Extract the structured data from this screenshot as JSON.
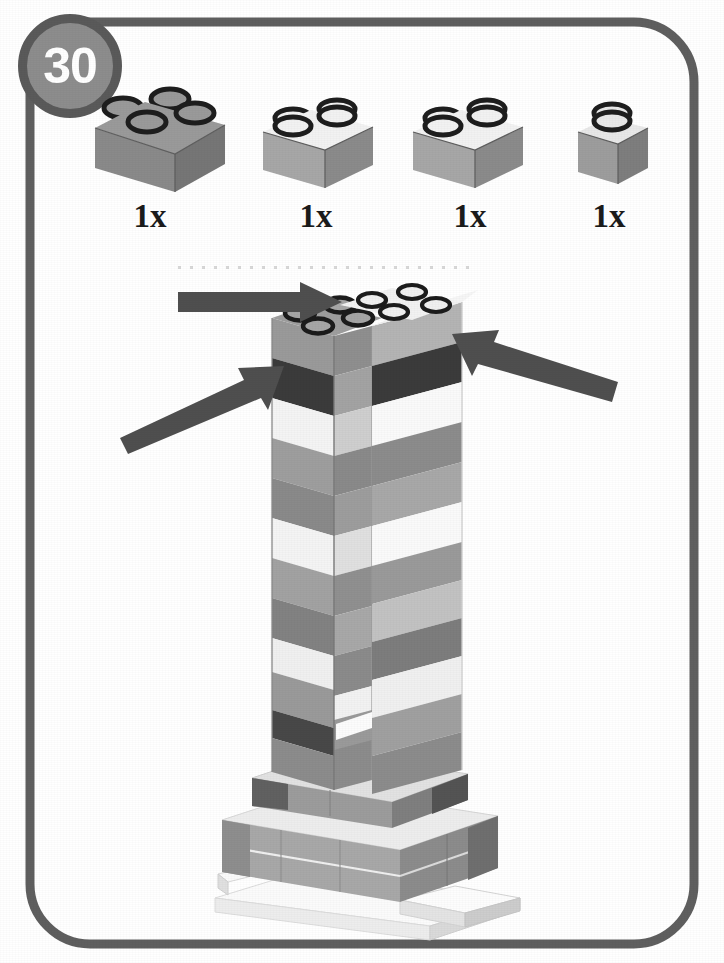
{
  "page": {
    "step_number": "30",
    "background_color": "#ffffff",
    "frame_color": "#5f5f5f",
    "badge_fill_color": "#8d8d8d",
    "badge_ring_color": "#5a5a5a",
    "badge_text_color": "#ffffff"
  },
  "parts_bin": {
    "items": [
      {
        "icon": "lego-brick-2x2-icon",
        "quantity_label": "1x",
        "brick_size": "2x2",
        "top_color": "#9a9a9a",
        "left_color": "#8a8a8a",
        "right_color": "#7a7a7a",
        "stud_color": "#1e1e1e"
      },
      {
        "icon": "lego-brick-2x1-icon",
        "quantity_label": "1x",
        "brick_size": "2x1",
        "top_color": "#f2f2f2",
        "left_color": "#a7a7a7",
        "right_color": "#8f8f8f",
        "stud_color": "#1e1e1e"
      },
      {
        "icon": "lego-brick-2x1-icon",
        "quantity_label": "1x",
        "brick_size": "2x1",
        "top_color": "#f2f2f2",
        "left_color": "#a7a7a7",
        "right_color": "#8f8f8f",
        "stud_color": "#1e1e1e"
      },
      {
        "icon": "lego-brick-1x1-icon",
        "quantity_label": "1x",
        "brick_size": "1x1",
        "top_color": "#e8e8e8",
        "left_color": "#9d9d9d",
        "right_color": "#7e7e7e",
        "stud_color": "#1e1e1e"
      }
    ]
  },
  "model": {
    "description": "Partially built grey and white brick tower on a baseplate",
    "arrow_color": "#4f4f4f",
    "guide_line_color": "#d8d8d8",
    "arrows": [
      {
        "name": "placement-arrow-top",
        "direction": "right"
      },
      {
        "name": "placement-arrow-left",
        "direction": "up-right"
      },
      {
        "name": "placement-arrow-right",
        "direction": "up-left"
      }
    ],
    "tower": {
      "left_column_bands": [
        "#9a9a9a",
        "#3b3b3b",
        "#f4f4f4",
        "#9e9e9e",
        "#8a8a8a",
        "#f4f4f4",
        "#a2a2a2",
        "#7f7f7f",
        "#f0f0f0",
        "#9a9a9a",
        "#454545",
        "#8c8c8c"
      ],
      "right_column_bands": [
        "#b4b4b4",
        "#3b3b3b",
        "#fafafa",
        "#8c8c8c",
        "#a8a8a8",
        "#fafafa",
        "#9a9a9a",
        "#c0c0c0",
        "#7d7d7d",
        "#f0f0f0",
        "#a0a0a0",
        "#8c8c8c"
      ],
      "base_colors": {
        "top": "#e6e6e6",
        "front": "#a8a8a8",
        "side": "#8c8c8c",
        "plate": "#f4f4f4"
      }
    }
  }
}
